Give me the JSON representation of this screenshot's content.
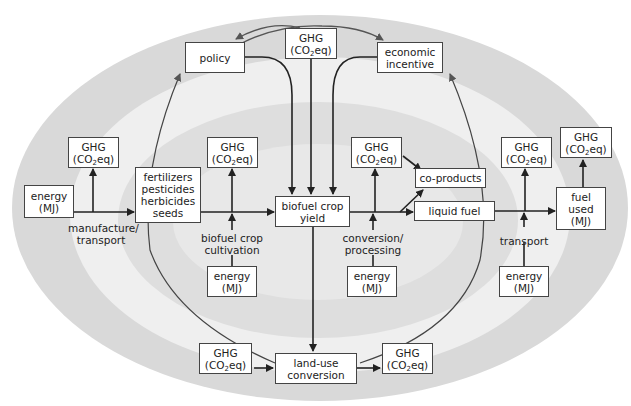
{
  "diagram": {
    "type": "life-cycle flow diagram",
    "colors": {
      "outer_band": "#d9d9d9",
      "middle_band": "#efefef",
      "inner_band": "#dcdcdc",
      "core": "#e6e6e6",
      "box_border": "#444444",
      "line": "#222222"
    },
    "ghg": {
      "line1": "GHG",
      "line2_pre": "(CO",
      "line2_sub": "2",
      "line2_post": "eq)"
    },
    "energy": {
      "line1": "energy",
      "line2": "(MJ)"
    },
    "boxes": {
      "policy": "policy",
      "economic_incentive": {
        "line1": "economic",
        "line2": "incentive"
      },
      "inputs": {
        "line1": "fertilizers",
        "line2": "pesticides",
        "line3": "herbicides",
        "line4": "seeds"
      },
      "biofuel_crop_yield": {
        "line1": "biofuel crop",
        "line2": "yield"
      },
      "co_products": "co-products",
      "liquid_fuel": "liquid fuel",
      "fuel_used": {
        "line1": "fuel",
        "line2": "used",
        "line3": "(MJ)"
      },
      "land_use_conversion": {
        "line1": "land-use",
        "line2": "conversion"
      }
    },
    "labels": {
      "manufacture_transport": {
        "line1": "manufacture/",
        "line2": "transport"
      },
      "crop_cultivation": {
        "line1": "biofuel crop",
        "line2": "cultivation"
      },
      "conversion_processing": {
        "line1": "conversion/",
        "line2": "processing"
      },
      "transport": "transport"
    }
  }
}
